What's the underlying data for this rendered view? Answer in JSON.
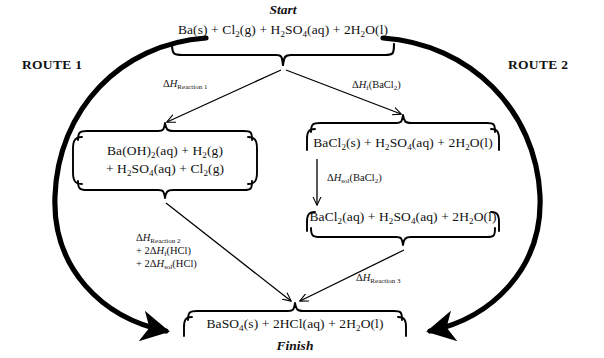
{
  "diagram": {
    "title_marker_start": "Start",
    "title_marker_finish": "Finish",
    "route_left": "ROUTE 1",
    "route_right": "ROUTE 2",
    "colors": {
      "ink": "#000000",
      "background": "#ffffff"
    },
    "nodes": {
      "start": {
        "id": "start",
        "text": "Ba(s) + Cl2(g) + H2SO4(aq) + 2H2O(l)",
        "html": "Ba(s) + Cl<sub>2</sub>(g) + H<sub>2</sub>SO<sub>4</sub>(aq) + 2H<sub>2</sub>O(l)"
      },
      "route1_intermediate_line1": {
        "text": "Ba(OH)2(aq) + H2(g)",
        "html": "Ba(OH)<sub>2</sub>(aq) + H<sub>2</sub>(g)"
      },
      "route1_intermediate_line2": {
        "text": "+ H2SO4(aq) + Cl2(g)",
        "html": "+ H<sub>2</sub>SO<sub>4</sub>(aq) + Cl<sub>2</sub>(g)"
      },
      "route2_intermediate_solid": {
        "text": "BaCl2(s) + H2SO4(aq) + 2H2O(l)",
        "html": "BaCl<sub>2</sub>(s) + H<sub>2</sub>SO<sub>4</sub>(aq) + 2H<sub>2</sub>O(l)"
      },
      "route2_intermediate_aqueous": {
        "text": "BaCl2(aq) + H2SO4(aq) + 2H2O(l)",
        "html": "BaCl<sub>2</sub>(aq) + H<sub>2</sub>SO<sub>4</sub>(aq) + 2H<sub>2</sub>O(l)"
      },
      "finish": {
        "text": "BaSO4(s) + 2HCl(aq) + 2H2O(l)",
        "html": "BaSO<sub>4</sub>(s) + 2HCl(aq) + 2H<sub>2</sub>O(l)"
      }
    },
    "enthalpy_labels": {
      "reaction_1": {
        "text": "ΔH Reaction 1",
        "html": "&Delta;<i>H</i><span class=\"sb\">Reaction 1</span>"
      },
      "formation_bacl2": {
        "text": "ΔHf(BaCl2)",
        "html": "&Delta;<i>H</i><span class=\"sb\">f</span>(BaCl<span class=\"sb\">2</span>)"
      },
      "solution_bacl2": {
        "text": "ΔHsol(BaCl2)",
        "html": "&Delta;<i>H</i><span class=\"sb\">sol</span>(BaCl<span class=\"sb\">2</span>)"
      },
      "reaction_2_line1": {
        "text": "ΔH Reaction 2",
        "html": "&Delta;<i>H</i><span class=\"sb\">Reaction 2</span>"
      },
      "reaction_2_line2": {
        "text": "+ 2ΔHf(HCl)",
        "html": "+ 2&Delta;<i>H</i><span class=\"sb\">f</span>(HCl)"
      },
      "reaction_2_line3": {
        "text": "+ 2ΔHsol(HCl)",
        "html": "+ 2&Delta;<i>H</i><span class=\"sb\">sol</span>(HCl)"
      },
      "reaction_3": {
        "text": "ΔH Reaction 3",
        "html": "&Delta;<i>H</i><span class=\"sb\">Reaction 3</span>"
      }
    }
  }
}
